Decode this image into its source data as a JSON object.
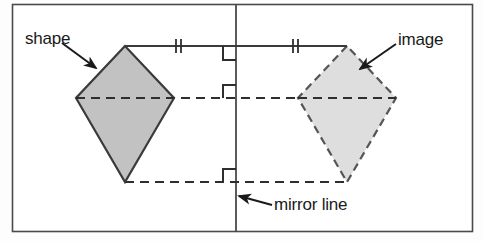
{
  "figure": {
    "labels": {
      "shape": "shape",
      "image": "image",
      "mirror_line": "mirror line"
    },
    "colors": {
      "shape_fill": "#c2c2c2",
      "image_fill": "#dedede",
      "stroke": "#3a3a3a",
      "border": "#4a4a4a",
      "background": "#ffffff",
      "text": "#1a1a1a"
    },
    "frame": {
      "x": 12,
      "y": 4,
      "width": 461,
      "height": 228
    },
    "mirror_line": {
      "x": 236,
      "y1": 4,
      "y2": 232,
      "style": "solid"
    },
    "shapes": [
      {
        "name": "shape",
        "type": "kite",
        "style": "solid",
        "fill": "#c2c2c2",
        "vertices": [
          [
            125,
            46
          ],
          [
            76,
            98
          ],
          [
            125,
            182
          ],
          [
            174,
            98
          ]
        ]
      },
      {
        "name": "image",
        "type": "kite",
        "style": "dashed",
        "fill": "#dedede",
        "vertices": [
          [
            347,
            46
          ],
          [
            298,
            98
          ],
          [
            347,
            182
          ],
          [
            396,
            98
          ]
        ]
      }
    ],
    "connectors": [
      {
        "name": "top-connector",
        "y": 46,
        "x1": 125,
        "x2": 347,
        "style": "solid",
        "ticks": 2
      },
      {
        "name": "middle-connector",
        "y": 98,
        "x1": 76,
        "x2": 396,
        "style": "dashed",
        "ticks": 0
      },
      {
        "name": "bottom-connector",
        "y": 182,
        "x1": 125,
        "x2": 347,
        "style": "dashed",
        "ticks": 0
      }
    ],
    "right_angle_markers": [
      {
        "name": "right-angle-top",
        "x": 224,
        "y": 46,
        "size": 12,
        "position": "below-left"
      },
      {
        "name": "right-angle-middle",
        "x": 224,
        "y": 98,
        "size": 12,
        "position": "above-left"
      },
      {
        "name": "right-angle-bottom",
        "x": 224,
        "y": 182,
        "size": 12,
        "position": "above-left"
      }
    ],
    "tick_marks": [
      {
        "name": "tick-left",
        "x": 178,
        "y": 46
      },
      {
        "name": "tick-right",
        "x": 295,
        "y": 46
      }
    ],
    "arrows": [
      {
        "name": "shape-arrow",
        "from": [
          62,
          42
        ],
        "to": [
          98,
          70
        ]
      },
      {
        "name": "image-arrow",
        "from": [
          394,
          44
        ],
        "to": [
          358,
          70
        ]
      },
      {
        "name": "mirror-arrow",
        "from": [
          270,
          204
        ],
        "to": [
          238,
          196
        ]
      }
    ]
  }
}
